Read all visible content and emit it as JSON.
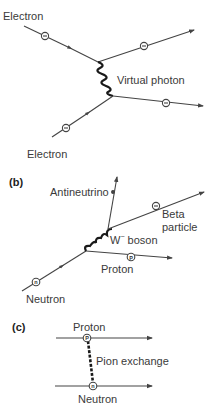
{
  "figure": {
    "panels": [
      {
        "id": "a",
        "label": "",
        "title": "Electron-electron scattering via virtual photon",
        "labels": {
          "electron_top": "Electron",
          "exchange": "Virtual photon",
          "electron_bottom": "Electron"
        },
        "particle_markers": [
          "−",
          "−",
          "−",
          "−"
        ]
      },
      {
        "id": "b",
        "label": "(b)",
        "labels": {
          "antineutrino": "Antineutrino",
          "beta_line1": "Beta",
          "beta_line2": "particle",
          "exchange": "W",
          "exchange_sup": "−",
          "exchange_suffix": " boson",
          "proton": "Proton",
          "neutron": "Neutron"
        },
        "particle_markers": {
          "beta": "−",
          "proton": "P",
          "neutron": "n"
        }
      },
      {
        "id": "c",
        "label": "(c)",
        "labels": {
          "proton": "Proton",
          "exchange": "Pion exchange",
          "neutron": "Neutron"
        },
        "particle_markers": {
          "proton": "P",
          "neutron": "n"
        }
      }
    ],
    "colors": {
      "line": "#444444",
      "wavy": "#1a1a1a",
      "text": "#3a3a3a"
    }
  }
}
